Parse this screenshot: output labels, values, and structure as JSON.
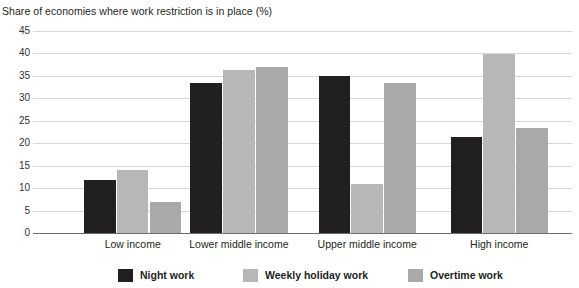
{
  "chart_data": {
    "type": "bar",
    "title": "Share of economies where work restriction is in place (%)",
    "xlabel": "",
    "ylabel": "",
    "ylim": [
      0,
      45
    ],
    "yticks": [
      0,
      5,
      10,
      15,
      20,
      25,
      30,
      35,
      40,
      45
    ],
    "grid": true,
    "legend_position": "bottom",
    "categories": [
      "Low income",
      "Lower middle income",
      "Upper middle income",
      "High income"
    ],
    "series": [
      {
        "name": "Night work",
        "color": "#211f1f",
        "values": [
          11.9,
          33.4,
          35.0,
          21.5
        ]
      },
      {
        "name": "Weekly holiday work",
        "color": "#b7b7b7",
        "values": [
          14.1,
          36.3,
          11.0,
          39.9
        ]
      },
      {
        "name": "Overtime work",
        "color": "#a9a9a9",
        "values": [
          7.0,
          37.0,
          33.4,
          23.5
        ]
      }
    ]
  },
  "layout": {
    "group_centers_pct": [
      18.5,
      38.2,
      62.0,
      86.5
    ],
    "legend_item_left_px": [
      118,
      243,
      408
    ]
  }
}
